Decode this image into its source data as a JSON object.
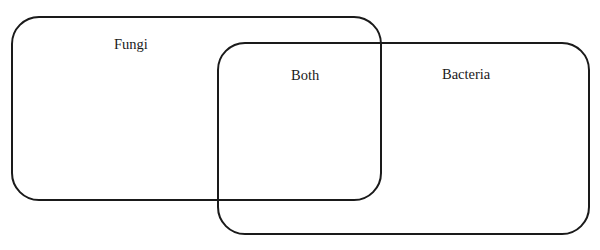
{
  "diagram": {
    "type": "venn-rounded-rectangles",
    "sets": [
      {
        "id": "fungi",
        "label": "Fungi"
      },
      {
        "id": "bacteria",
        "label": "Bacteria"
      }
    ],
    "intersection": {
      "label": "Both"
    },
    "colors": {
      "stroke": "#1a1a1a",
      "background": "#ffffff",
      "text": "#1a1a1a"
    }
  }
}
